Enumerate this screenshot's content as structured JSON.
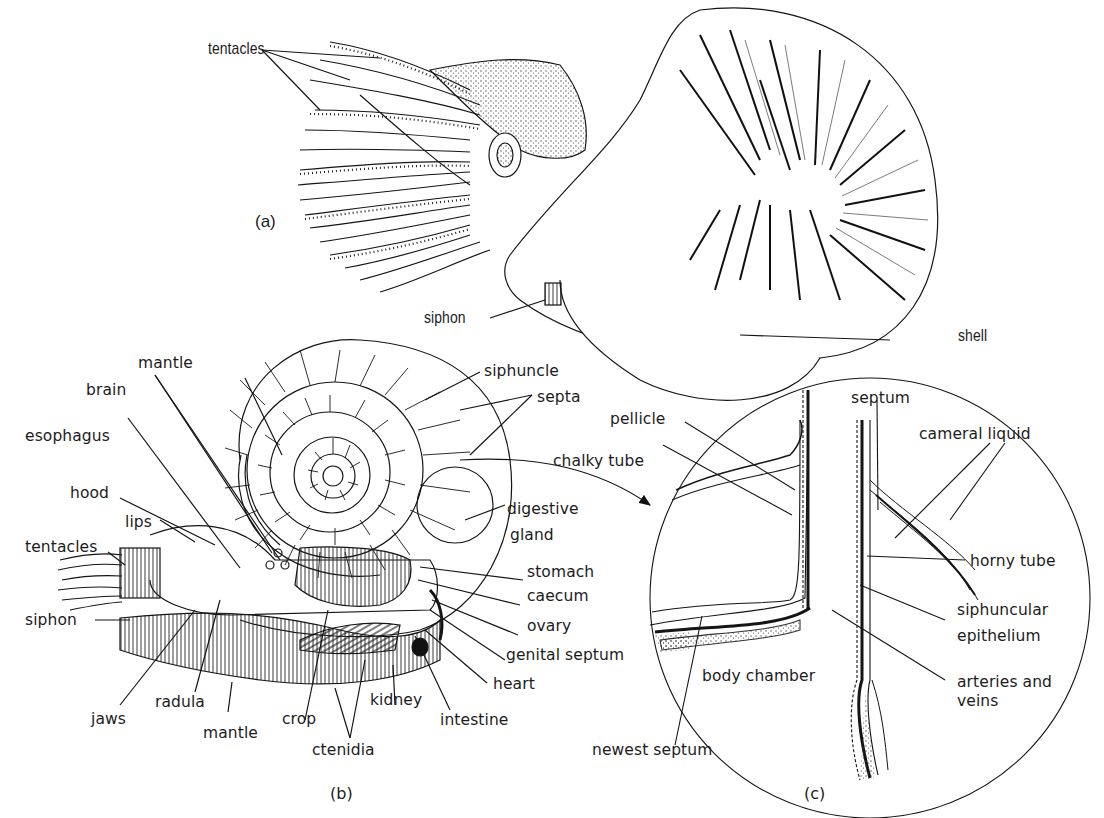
{
  "figure": {
    "colors": {
      "ink": "#1a1a1a",
      "background": "#ffffff",
      "stipple": "#555555"
    },
    "panels": {
      "a": {
        "letter": "(a)",
        "title": "External view of Nautilus",
        "labels": {
          "tentacles": "tentacles",
          "siphon": "siphon",
          "shell": "shell"
        }
      },
      "b": {
        "letter": "(b)",
        "title": "Internal anatomy (sagittal section)",
        "labels": {
          "mantle_top": "mantle",
          "brain": "brain",
          "esophagus": "esophagus",
          "hood": "hood",
          "lips": "lips",
          "tentacles": "tentacles",
          "siphon": "siphon",
          "jaws": "jaws",
          "radula": "radula",
          "mantle_bottom": "mantle",
          "crop": "crop",
          "ctenidia": "ctenidia",
          "kidney": "kidney",
          "intestine": "intestine",
          "heart": "heart",
          "genital_septum": "genital septum",
          "ovary": "ovary",
          "caecum": "caecum",
          "stomach": "stomach",
          "digestive_gland_1": "digestive",
          "digestive_gland_2": "gland",
          "siphuncle": "siphuncle",
          "septa": "septa"
        }
      },
      "c": {
        "letter": "(c)",
        "title": "Enlarged siphuncle detail",
        "labels": {
          "pellicle": "pellicle",
          "chalky_tube": "chalky tube",
          "septum": "septum",
          "cameral_liquid": "cameral liquid",
          "horny_tube": "horny tube",
          "siphuncular_1": "siphuncular",
          "siphuncular_2": "epithelium",
          "arteries_1": "arteries and",
          "arteries_2": "veins",
          "body_chamber": "body chamber",
          "newest_septum": "newest septum"
        }
      }
    }
  }
}
